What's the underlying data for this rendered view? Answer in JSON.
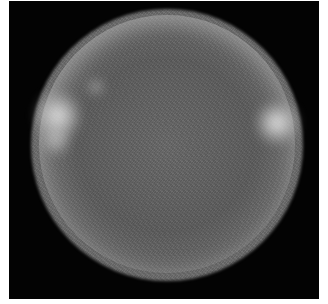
{
  "image": {
    "description": "Grayscale image of a bright spherical object on black background with brighter limb and two bright spots on left and right edges",
    "background_color": "#030303",
    "margin_color": "#ffffff",
    "sphere_color": "#6a6a6a",
    "highlight_color": "#f0f0f0"
  }
}
